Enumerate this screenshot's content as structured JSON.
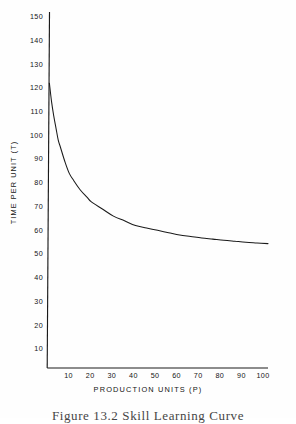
{
  "figure": {
    "caption": "Figure 13.2  Skill Learning Curve",
    "background_color": "#fefefe",
    "ink_color": "#141414"
  },
  "chart_data": {
    "type": "line",
    "title": "",
    "subtitle": "",
    "xlabel": "PRODUCTION UNITS (P)",
    "ylabel": "TIME PER UNIT (T)",
    "xlim": [
      0,
      100
    ],
    "ylim": [
      0,
      150
    ],
    "grid": false,
    "legend": null,
    "legend_position": "none",
    "xticks": [
      10,
      20,
      30,
      40,
      50,
      60,
      70,
      80,
      90,
      100
    ],
    "yticks": [
      10,
      20,
      30,
      40,
      50,
      60,
      70,
      80,
      90,
      100,
      110,
      120,
      130,
      140,
      150
    ],
    "xtick_labels": [
      "10",
      "20",
      "30",
      "40",
      "50",
      "60",
      "70",
      "80",
      "90",
      "100"
    ],
    "ytick_labels": [
      "10",
      "20",
      "30",
      "40",
      "50",
      "60",
      "70",
      "80",
      "90",
      "100",
      "110",
      "120",
      "130",
      "140",
      "150"
    ],
    "line_color": "#1a1a1a",
    "series": [
      {
        "name": "Time per unit",
        "x": [
          1,
          2,
          3,
          4,
          5,
          6,
          8,
          10,
          12,
          15,
          18,
          20,
          25,
          30,
          35,
          40,
          45,
          50,
          55,
          60,
          65,
          70,
          75,
          80,
          85,
          90,
          95,
          100
        ],
        "y": [
          120,
          112,
          106,
          101,
          96,
          93,
          87,
          82,
          79,
          75,
          72,
          70,
          67,
          64,
          62,
          60,
          59,
          58,
          57,
          56,
          55.4,
          54.8,
          54.3,
          53.8,
          53.4,
          53,
          52.7,
          52.4
        ]
      }
    ],
    "annotations": []
  }
}
